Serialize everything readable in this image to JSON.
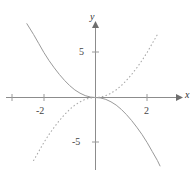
{
  "figure": {
    "kind": "cartesian-graph",
    "background_color": "#ffffff",
    "axis_color": "#8c8c8c",
    "curve_color": "#9a9a9a",
    "label_color": "#444444"
  },
  "axes": {
    "x_label": "x",
    "y_label": "y",
    "x_ticks": [
      {
        "value": -4,
        "label": ""
      },
      {
        "value": -2,
        "label": "-2"
      },
      {
        "value": 2,
        "label": "2"
      }
    ],
    "y_ticks": [
      {
        "value": 5,
        "label": "5"
      },
      {
        "value": -5,
        "label": "-5"
      }
    ],
    "x_range": [
      -4.3,
      3.7
    ],
    "y_range": [
      -6.2,
      5.8
    ],
    "origin_px": {
      "x": 95.5,
      "y": 97.5
    },
    "unit_px": {
      "x": 25.8,
      "y": 18.0
    }
  },
  "chart_data": {
    "type": "line",
    "title": "",
    "xlabel": "x",
    "ylabel": "y",
    "grid": false,
    "legend": "none",
    "xlim": [
      -4.3,
      3.7
    ],
    "ylim": [
      -6.2,
      5.8
    ],
    "xticks": [
      -2,
      2
    ],
    "xticklabels": [
      "-2",
      "2"
    ],
    "yticks": [
      5,
      -5
    ],
    "yticklabels": [
      "5",
      "-5"
    ],
    "series": [
      {
        "name": "solid-curve",
        "style": "solid",
        "color": "#9a9a9a",
        "x": [
          -2.66,
          -2.4,
          -2.2,
          -2.0,
          -1.8,
          -1.6,
          -1.4,
          -1.2,
          -1.0,
          -0.8,
          -0.6,
          -0.4,
          -0.2,
          0.0,
          0.2,
          0.4,
          0.6,
          0.8,
          1.0,
          1.2,
          1.4,
          1.6,
          1.8,
          2.0,
          2.2,
          2.4,
          2.5
        ],
        "y": [
          4.1,
          3.5,
          3.0,
          2.5,
          2.05,
          1.65,
          1.28,
          0.95,
          0.66,
          0.42,
          0.24,
          0.105,
          0.026,
          0.0,
          -0.026,
          -0.105,
          -0.24,
          -0.42,
          -0.66,
          -0.95,
          -1.28,
          -1.65,
          -2.05,
          -2.5,
          -3.0,
          -3.5,
          -3.8
        ]
      },
      {
        "name": "dotted-curve",
        "style": "dotted",
        "color": "#a8a8a8",
        "x": [
          -2.4,
          -2.2,
          -2.0,
          -1.8,
          -1.6,
          -1.4,
          -1.2,
          -1.0,
          -0.8,
          -0.6,
          -0.4,
          -0.2,
          0.0,
          0.2,
          0.4,
          0.6,
          0.8,
          1.0,
          1.2,
          1.4,
          1.6,
          1.8,
          2.0,
          2.2,
          2.4
        ],
        "y": [
          -3.5,
          -3.0,
          -2.5,
          -2.05,
          -1.65,
          -1.28,
          -0.95,
          -0.66,
          -0.42,
          -0.24,
          -0.105,
          -0.026,
          0.0,
          0.026,
          0.105,
          0.24,
          0.42,
          0.66,
          0.95,
          1.28,
          1.65,
          2.05,
          2.5,
          3.0,
          3.5
        ]
      }
    ]
  }
}
